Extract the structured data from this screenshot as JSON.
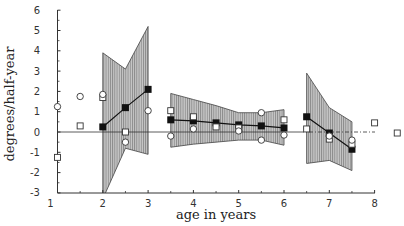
{
  "chart_data": {
    "type": "scatter",
    "title": "",
    "xlabel": "age in years",
    "ylabel": "degrees/half-year",
    "xlim": [
      1,
      8
    ],
    "ylim": [
      -3,
      6
    ],
    "xticks": [
      1,
      2,
      3,
      4,
      5,
      6,
      7,
      8
    ],
    "yticks": [
      -3,
      -2,
      -1,
      0,
      1,
      2,
      3,
      4,
      5,
      6
    ],
    "grid": false,
    "reference_line": {
      "y": 0,
      "style": "dash-dot"
    },
    "series": [
      {
        "name": "mean (filled squares)",
        "marker": "filled-square",
        "connected_groups": [
          [
            [
              2.0,
              0.25
            ],
            [
              2.5,
              1.2
            ],
            [
              3.0,
              2.1
            ]
          ],
          [
            [
              3.5,
              0.6
            ],
            [
              4.0,
              0.55
            ],
            [
              4.5,
              0.45
            ],
            [
              5.0,
              0.35
            ],
            [
              5.5,
              0.3
            ],
            [
              6.0,
              0.2
            ]
          ],
          [
            [
              6.5,
              0.75
            ],
            [
              7.0,
              -0.05
            ],
            [
              7.5,
              -0.85
            ]
          ]
        ]
      },
      {
        "name": "individual (open squares)",
        "marker": "open-square",
        "points": [
          [
            1.0,
            -1.25
          ],
          [
            1.5,
            0.3
          ],
          [
            2.0,
            1.7
          ],
          [
            2.5,
            0.0
          ],
          [
            3.5,
            1.05
          ],
          [
            4.0,
            0.75
          ],
          [
            4.5,
            0.25
          ],
          [
            5.0,
            0.2
          ],
          [
            6.0,
            0.6
          ],
          [
            6.5,
            0.15
          ],
          [
            7.0,
            -0.35
          ],
          [
            7.5,
            -0.6
          ],
          [
            8.0,
            0.45
          ],
          [
            8.5,
            -0.05
          ]
        ]
      },
      {
        "name": "individual (open circles)",
        "marker": "open-circle",
        "points": [
          [
            1.0,
            1.25
          ],
          [
            1.5,
            1.75
          ],
          [
            2.0,
            1.85
          ],
          [
            2.5,
            -0.5
          ],
          [
            3.0,
            1.05
          ],
          [
            3.5,
            -0.2
          ],
          [
            4.0,
            0.15
          ],
          [
            5.0,
            0.05
          ],
          [
            5.5,
            0.95
          ],
          [
            5.5,
            -0.4
          ],
          [
            6.0,
            -0.15
          ],
          [
            7.0,
            -0.2
          ],
          [
            7.5,
            -0.4
          ]
        ]
      }
    ],
    "confidence_bands": [
      {
        "x": [
          2.0,
          2.5,
          3.0
        ],
        "upper": [
          3.9,
          3.1,
          5.2
        ],
        "lower": [
          -3.3,
          -0.8,
          -1.1
        ]
      },
      {
        "x": [
          3.5,
          4.0,
          4.5,
          5.0,
          5.5,
          6.0
        ],
        "upper": [
          1.9,
          1.6,
          1.3,
          0.95,
          0.95,
          1.1
        ],
        "lower": [
          -0.75,
          -0.6,
          -0.5,
          -0.4,
          -0.4,
          -0.65
        ]
      },
      {
        "x": [
          6.5,
          7.0,
          7.5
        ],
        "upper": [
          2.9,
          1.2,
          0.5
        ],
        "lower": [
          -1.55,
          -1.4,
          -1.9
        ]
      }
    ],
    "colors": {
      "band_fill": "#b5b5b5",
      "band_hatch": "#555555",
      "marker": "#111111",
      "axis": "#333333"
    }
  }
}
